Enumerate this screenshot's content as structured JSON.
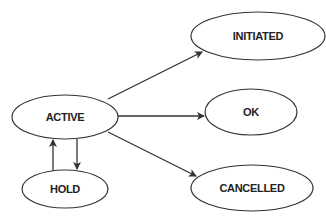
{
  "diagram": {
    "type": "state-transition",
    "colors": {
      "stroke": "#333333",
      "fill": "#ffffff",
      "text": "#222222"
    },
    "nodes": [
      {
        "id": "active",
        "label": "ACTIVE",
        "cx": 65,
        "cy": 117,
        "rx": 53,
        "ry": 22
      },
      {
        "id": "hold",
        "label": "HOLD",
        "cx": 65,
        "cy": 188,
        "rx": 43,
        "ry": 19
      },
      {
        "id": "initiated",
        "label": "INITIATED",
        "cx": 258,
        "cy": 37,
        "rx": 67,
        "ry": 24
      },
      {
        "id": "ok",
        "label": "OK",
        "cx": 251,
        "cy": 112,
        "rx": 46,
        "ry": 23
      },
      {
        "id": "cancelled",
        "label": "CANCELLED",
        "cx": 252,
        "cy": 188,
        "rx": 61,
        "ry": 23
      }
    ],
    "edges": [
      {
        "from": "active",
        "to": "initiated"
      },
      {
        "from": "active",
        "to": "ok"
      },
      {
        "from": "active",
        "to": "cancelled"
      },
      {
        "from": "hold",
        "to": "active"
      },
      {
        "from": "active",
        "to": "hold"
      }
    ]
  }
}
